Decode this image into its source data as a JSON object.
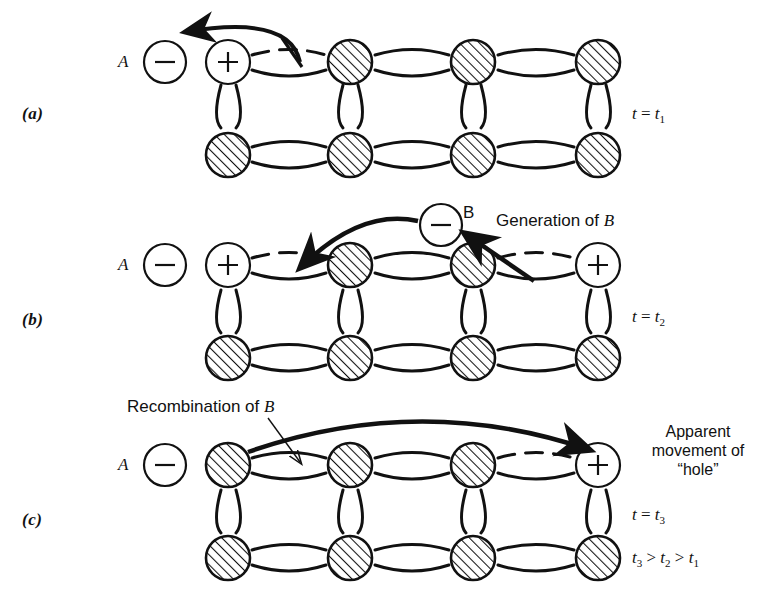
{
  "figure": {
    "width": 771,
    "height": 599,
    "background": "#ffffff",
    "ink": "#111111"
  },
  "panels": [
    {
      "id": "a",
      "label": "(a)",
      "time_label": {
        "var": "t",
        "eq": "=",
        "sub_var": "t",
        "sub": "1",
        "text": "t = t1"
      },
      "free_electron": {
        "label": "A",
        "charge": "−"
      },
      "top_row": [
        "positive-ion",
        "hatched-atom",
        "hatched-atom",
        "hatched-atom"
      ],
      "bottom_row": [
        "hatched-atom",
        "hatched-atom",
        "hatched-atom",
        "hatched-atom"
      ],
      "broken_bond_top": [
        1
      ],
      "annotations": []
    },
    {
      "id": "b",
      "label": "(b)",
      "time_label": {
        "var": "t",
        "eq": "=",
        "sub_var": "t",
        "sub": "2",
        "text": "t = t2"
      },
      "free_electron": {
        "label": "A",
        "charge": "−"
      },
      "second_electron": {
        "label": "B",
        "charge": "−"
      },
      "top_row": [
        "positive-ion",
        "hatched-atom",
        "hatched-atom",
        "positive-ion"
      ],
      "bottom_row": [
        "hatched-atom",
        "hatched-atom",
        "hatched-atom",
        "hatched-atom"
      ],
      "broken_bond_top": [
        1,
        3
      ],
      "annotations": [
        {
          "name": "generation-label",
          "text_prefix": "Generation of ",
          "text_italic": "B"
        }
      ]
    },
    {
      "id": "c",
      "label": "(c)",
      "time_label": {
        "var": "t",
        "eq": "=",
        "sub_var": "t",
        "sub": "3",
        "text": "t = t3"
      },
      "free_electron": {
        "label": "A",
        "charge": "−"
      },
      "top_row": [
        "hatched-atom",
        "hatched-atom",
        "hatched-atom",
        "positive-ion"
      ],
      "bottom_row": [
        "hatched-atom",
        "hatched-atom",
        "hatched-atom",
        "hatched-atom"
      ],
      "broken_bond_top": [
        3
      ],
      "annotations": [
        {
          "name": "recombination-label",
          "text_prefix": "Recombination of ",
          "text_italic": "B"
        },
        {
          "name": "apparent-movement-label",
          "line1": "Apparent",
          "line2": "movement of",
          "line3": "“hole”"
        }
      ]
    }
  ],
  "inequality": {
    "text": "t3 > t2 > t1",
    "terms": [
      "t",
      "3",
      ">",
      "t",
      "2",
      ">",
      "t",
      "1"
    ]
  },
  "legend_notes": {
    "hatched_atom": "hatched-circle-atom",
    "positive_ion": "plus-circle-ion",
    "electron": "minus-circle-electron",
    "bond_solid": "solid-covalent-bond",
    "bond_broken": "dashed-broken-bond"
  }
}
